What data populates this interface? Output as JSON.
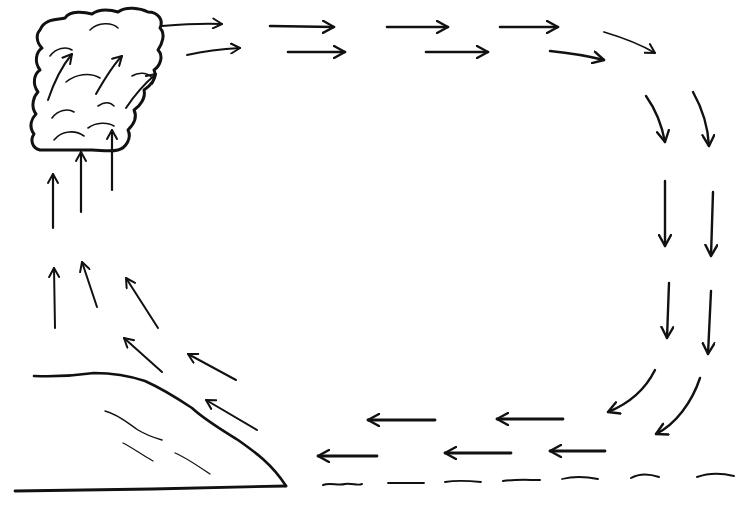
{
  "diagram": {
    "type": "sea-breeze-circulation",
    "labels": [],
    "colors": {
      "background": "#ffffff",
      "ink": "#111111",
      "cloud_fill": "#cfcfcf",
      "faint_ink": "#555555"
    },
    "elements": {
      "cloud": "cumulus-cloud",
      "land": "land-slope",
      "sea": "sea-surface-waves"
    },
    "flow": [
      "rising-air-over-land",
      "outflow-aloft-toward-sea",
      "sinking-air-over-sea",
      "onshore-surface-wind"
    ]
  }
}
